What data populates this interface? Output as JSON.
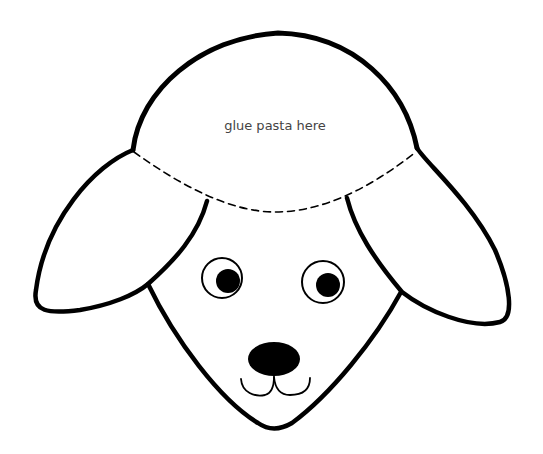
{
  "instruction_text": "glue pasta here",
  "colors": {
    "outline": "#000000",
    "background": "#ffffff",
    "text": "#444444"
  },
  "parts": {
    "head_top": "woolly head area (pasta glue zone)",
    "dashed_line": "fold/cut guide",
    "left_ear": "ear",
    "right_ear": "ear",
    "face": "face",
    "left_eye": "eye",
    "right_eye": "eye",
    "nose": "nose",
    "mouth": "mouth"
  }
}
